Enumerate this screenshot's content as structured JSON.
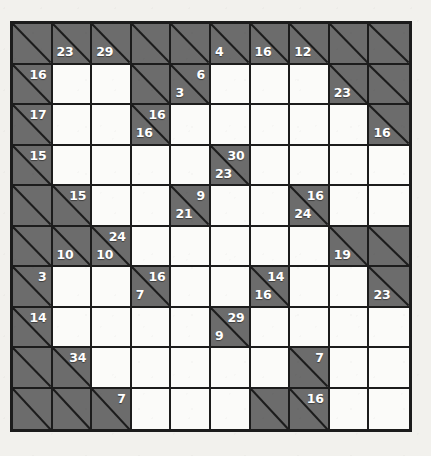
{
  "puzzle": {
    "name": "Kakuro",
    "rows": 10,
    "cols": 10,
    "colors": {
      "page_background": "#f2f1ed",
      "block_fill": "#6c6c6c",
      "open_fill": "#fbfbf9",
      "line": "#1c1c1c",
      "clue_text": "#ffffff"
    },
    "cells": [
      [
        {
          "t": "block"
        },
        {
          "t": "block",
          "down": "23"
        },
        {
          "t": "block",
          "down": "29"
        },
        {
          "t": "block"
        },
        {
          "t": "block"
        },
        {
          "t": "block",
          "down": "4"
        },
        {
          "t": "block",
          "down": "16"
        },
        {
          "t": "block",
          "down": "12"
        },
        {
          "t": "block"
        },
        {
          "t": "block"
        }
      ],
      [
        {
          "t": "block",
          "across": "16"
        },
        {
          "t": "open"
        },
        {
          "t": "open"
        },
        {
          "t": "block"
        },
        {
          "t": "block",
          "across": "6",
          "down": "3"
        },
        {
          "t": "open"
        },
        {
          "t": "open"
        },
        {
          "t": "open"
        },
        {
          "t": "block",
          "down": "23"
        },
        {
          "t": "block"
        }
      ],
      [
        {
          "t": "block",
          "across": "17"
        },
        {
          "t": "open"
        },
        {
          "t": "open"
        },
        {
          "t": "block",
          "across": "16",
          "down": "16"
        },
        {
          "t": "open"
        },
        {
          "t": "open"
        },
        {
          "t": "open"
        },
        {
          "t": "open"
        },
        {
          "t": "open"
        },
        {
          "t": "block",
          "down": "16"
        }
      ],
      [
        {
          "t": "block",
          "across": "15"
        },
        {
          "t": "open"
        },
        {
          "t": "open"
        },
        {
          "t": "open"
        },
        {
          "t": "open"
        },
        {
          "t": "block",
          "across": "30",
          "down": "23"
        },
        {
          "t": "open"
        },
        {
          "t": "open"
        },
        {
          "t": "open"
        },
        {
          "t": "open"
        }
      ],
      [
        {
          "t": "block"
        },
        {
          "t": "block",
          "across": "15"
        },
        {
          "t": "open"
        },
        {
          "t": "open"
        },
        {
          "t": "block",
          "across": "9",
          "down": "21"
        },
        {
          "t": "open"
        },
        {
          "t": "open"
        },
        {
          "t": "block",
          "across": "16",
          "down": "24"
        },
        {
          "t": "open"
        },
        {
          "t": "open"
        }
      ],
      [
        {
          "t": "block"
        },
        {
          "t": "block",
          "down": "10"
        },
        {
          "t": "block",
          "across": "24",
          "down": "10"
        },
        {
          "t": "open"
        },
        {
          "t": "open"
        },
        {
          "t": "open"
        },
        {
          "t": "open"
        },
        {
          "t": "open"
        },
        {
          "t": "block",
          "down": "19"
        },
        {
          "t": "block"
        }
      ],
      [
        {
          "t": "block",
          "across": "3"
        },
        {
          "t": "open"
        },
        {
          "t": "open"
        },
        {
          "t": "block",
          "across": "16",
          "down": "7"
        },
        {
          "t": "open"
        },
        {
          "t": "open"
        },
        {
          "t": "block",
          "across": "14",
          "down": "16"
        },
        {
          "t": "open"
        },
        {
          "t": "open"
        },
        {
          "t": "block",
          "down": "23"
        }
      ],
      [
        {
          "t": "block",
          "across": "14"
        },
        {
          "t": "open"
        },
        {
          "t": "open"
        },
        {
          "t": "open"
        },
        {
          "t": "open"
        },
        {
          "t": "block",
          "across": "29",
          "down": "9"
        },
        {
          "t": "open"
        },
        {
          "t": "open"
        },
        {
          "t": "open"
        },
        {
          "t": "open"
        }
      ],
      [
        {
          "t": "block"
        },
        {
          "t": "block",
          "across": "34"
        },
        {
          "t": "open"
        },
        {
          "t": "open"
        },
        {
          "t": "open"
        },
        {
          "t": "open"
        },
        {
          "t": "open"
        },
        {
          "t": "block",
          "across": "7"
        },
        {
          "t": "open"
        },
        {
          "t": "open"
        }
      ],
      [
        {
          "t": "block"
        },
        {
          "t": "block"
        },
        {
          "t": "block",
          "across": "7"
        },
        {
          "t": "open"
        },
        {
          "t": "open"
        },
        {
          "t": "open"
        },
        {
          "t": "block"
        },
        {
          "t": "block",
          "across": "16"
        },
        {
          "t": "open"
        },
        {
          "t": "open"
        }
      ]
    ]
  }
}
